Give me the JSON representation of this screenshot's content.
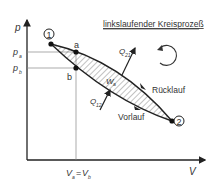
{
  "title": "linkslaufender Kreisprozeß",
  "axes": {
    "y_label": "p",
    "x_label": "V",
    "y_ticks": [
      {
        "label": "p",
        "sub": "a"
      },
      {
        "label": "p",
        "sub": "b"
      }
    ],
    "x_tick": {
      "label": "V",
      "sub_a": "a",
      "eq": "=",
      "label2": "V",
      "sub_b": "b"
    }
  },
  "points": {
    "p1": "1",
    "p2": "2",
    "a": "a",
    "b": "b"
  },
  "labels": {
    "work": "W",
    "work_sub": "a",
    "q21": "Q",
    "q21_sub": "21",
    "q12": "Q",
    "q12_sub": "12",
    "return_path": "Rücklauf",
    "forward_path": "Vorlauf"
  },
  "icons": {
    "direction": "counterclockwise-arrow-icon"
  },
  "colors": {
    "line": "#222222",
    "grid": "#888888",
    "hatch": "#666666"
  }
}
